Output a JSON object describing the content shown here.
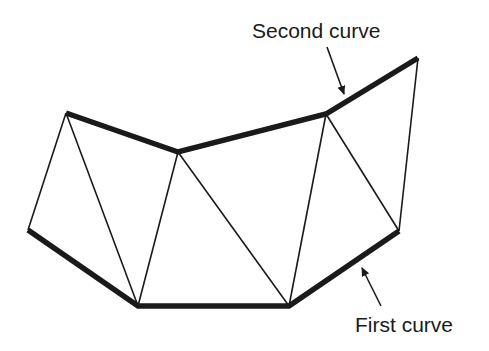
{
  "labels": {
    "second_curve": "Second curve",
    "first_curve": "First curve"
  },
  "colors": {
    "stroke": "#1a1a1a",
    "background": "#ffffff"
  },
  "vertices": {
    "A": [
      28,
      230
    ],
    "B": [
      138,
      306
    ],
    "C": [
      289,
      306
    ],
    "D": [
      399,
      231
    ],
    "E": [
      66,
      113
    ],
    "F": [
      178,
      152
    ],
    "G": [
      326,
      114
    ],
    "H": [
      418,
      58
    ]
  },
  "first_curve": [
    "A",
    "B",
    "C",
    "D"
  ],
  "second_curve": [
    "E",
    "F",
    "G",
    "H"
  ],
  "triangulation_edges": [
    [
      "A",
      "E"
    ],
    [
      "E",
      "B"
    ],
    [
      "B",
      "F"
    ],
    [
      "F",
      "C"
    ],
    [
      "C",
      "G"
    ],
    [
      "G",
      "D"
    ],
    [
      "D",
      "H"
    ]
  ],
  "arrows": {
    "second_curve": {
      "from": [
        327,
        47
      ],
      "to": [
        344,
        94
      ]
    },
    "first_curve": {
      "from": [
        381,
        306
      ],
      "to": [
        362,
        268
      ]
    }
  }
}
